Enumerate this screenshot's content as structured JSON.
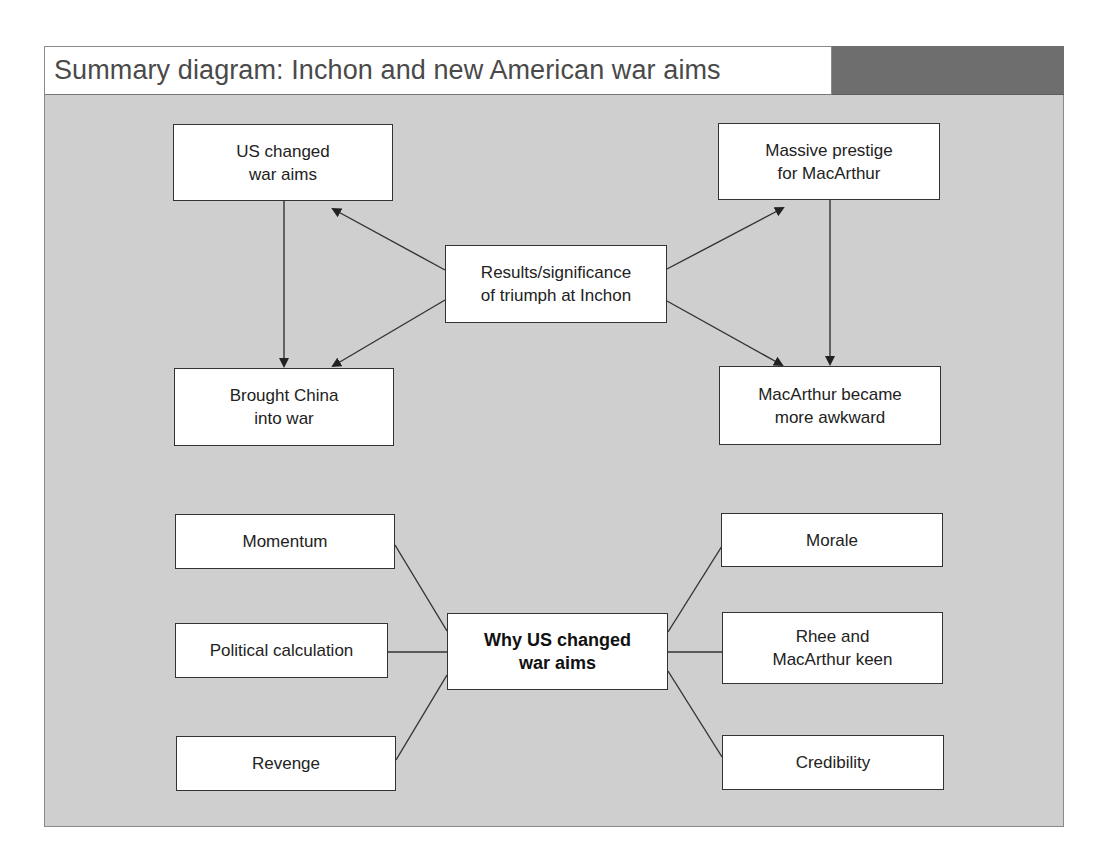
{
  "header": {
    "title": "Summary diagram: Inchon and new American war aims"
  },
  "colors": {
    "frame_background": "#cfcfcf",
    "title_bar_accent": "#6e6e6e",
    "node_background": "#ffffff",
    "line": "#333333"
  },
  "top_diagram": {
    "center": {
      "label": "Results/significance\nof triumph at Inchon"
    },
    "nodes": [
      {
        "id": "us-changed-war-aims",
        "label": "US changed\nwar aims"
      },
      {
        "id": "massive-prestige",
        "label": "Massive prestige\nfor MacArthur"
      },
      {
        "id": "brought-china",
        "label": "Brought China\ninto war"
      },
      {
        "id": "macarthur-awkward",
        "label": "MacArthur became\nmore awkward"
      }
    ],
    "edges": [
      {
        "from": "center",
        "to": "us-changed-war-aims",
        "arrow": true
      },
      {
        "from": "center",
        "to": "massive-prestige",
        "arrow": true
      },
      {
        "from": "center",
        "to": "brought-china",
        "arrow": true
      },
      {
        "from": "center",
        "to": "macarthur-awkward",
        "arrow": true
      },
      {
        "from": "us-changed-war-aims",
        "to": "brought-china",
        "arrow": true
      },
      {
        "from": "massive-prestige",
        "to": "macarthur-awkward",
        "arrow": true
      }
    ]
  },
  "bottom_diagram": {
    "center": {
      "label": "Why US changed\nwar aims"
    },
    "left_nodes": [
      {
        "label": "Momentum"
      },
      {
        "label": "Political calculation"
      },
      {
        "label": "Revenge"
      }
    ],
    "right_nodes": [
      {
        "label": "Morale"
      },
      {
        "label": "Rhee and\nMacArthur keen"
      },
      {
        "label": "Credibility"
      }
    ]
  }
}
